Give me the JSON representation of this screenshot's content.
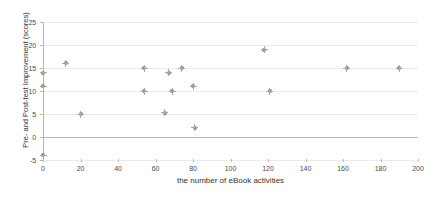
{
  "chart_data": {
    "type": "scatter",
    "title": "",
    "xlabel": "the number of eBook activities",
    "ylabel": "Pre- and Post-test Improvement (scores)",
    "xlim": [
      0,
      200
    ],
    "ylim": [
      -5,
      25
    ],
    "xticks": [
      0,
      20,
      40,
      60,
      80,
      100,
      120,
      140,
      160,
      180,
      200
    ],
    "yticks": [
      -5,
      0,
      5,
      10,
      15,
      20,
      25
    ],
    "xtick_labels": [
      "0",
      "20",
      "40",
      "60",
      "80",
      "100",
      "120",
      "140",
      "160",
      "180",
      "200"
    ],
    "ytick_labels": [
      "-5",
      "0",
      "5",
      "10",
      "15",
      "20",
      "25"
    ],
    "grid": true,
    "grid_axis": "y",
    "legend": false,
    "marker_color": "#8a8a8a",
    "grid_color": "#eceaea",
    "axis_color": "#b9b9b9",
    "points": [
      {
        "x": 0,
        "y": 14
      },
      {
        "x": 0,
        "y": 11
      },
      {
        "x": 0,
        "y": -4
      },
      {
        "x": 12,
        "y": 16
      },
      {
        "x": 20,
        "y": 5
      },
      {
        "x": 54,
        "y": 15
      },
      {
        "x": 54,
        "y": 10
      },
      {
        "x": 65,
        "y": 5.3
      },
      {
        "x": 67,
        "y": 14
      },
      {
        "x": 69,
        "y": 10
      },
      {
        "x": 74,
        "y": 15
      },
      {
        "x": 80,
        "y": 11
      },
      {
        "x": 81,
        "y": 2
      },
      {
        "x": 118,
        "y": 19
      },
      {
        "x": 121,
        "y": 10
      },
      {
        "x": 162,
        "y": 15
      },
      {
        "x": 190,
        "y": 15
      }
    ]
  }
}
